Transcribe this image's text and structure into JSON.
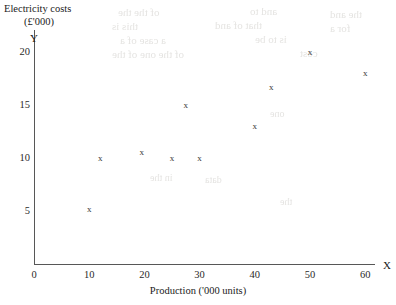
{
  "chart_data": {
    "type": "scatter",
    "title": "",
    "ylabel": "Electricity costs (£'000)",
    "ylabel_line1": "Electricity costs",
    "ylabel_line2": "(£'000)",
    "xlabel": "Production ('000 units)",
    "x_axis_letter": "X",
    "y_axis_letter": "Y",
    "xlim": [
      0,
      62
    ],
    "ylim": [
      0,
      22
    ],
    "xticks": [
      0,
      10,
      20,
      30,
      40,
      50,
      60
    ],
    "xtick_labels": [
      "0",
      "10",
      "20",
      "30",
      "40",
      "50",
      "60"
    ],
    "yticks": [
      5,
      10,
      15,
      20
    ],
    "ytick_labels": [
      "5",
      "10",
      "15",
      "20"
    ],
    "grid": false,
    "legend": null,
    "marker": "x",
    "points": [
      {
        "x": 10,
        "y": 5.2
      },
      {
        "x": 12,
        "y": 10.0
      },
      {
        "x": 19.5,
        "y": 10.6
      },
      {
        "x": 25,
        "y": 10.0
      },
      {
        "x": 27.5,
        "y": 15.0
      },
      {
        "x": 30,
        "y": 10.0
      },
      {
        "x": 40,
        "y": 13.0
      },
      {
        "x": 43,
        "y": 16.7
      },
      {
        "x": 50,
        "y": 20.0
      },
      {
        "x": 60,
        "y": 18.0
      }
    ]
  },
  "ghost_text": [
    {
      "text": "of the     the",
      "x": 118,
      "y": 6,
      "size": 11
    },
    {
      "text": "and to",
      "x": 250,
      "y": 5,
      "size": 11
    },
    {
      "text": "the    and",
      "x": 330,
      "y": 8,
      "size": 11
    },
    {
      "text": "this is",
      "x": 112,
      "y": 20,
      "size": 11
    },
    {
      "text": "that of and",
      "x": 215,
      "y": 19,
      "size": 11
    },
    {
      "text": "for a",
      "x": 330,
      "y": 22,
      "size": 11
    },
    {
      "text": "a case of a",
      "x": 120,
      "y": 34,
      "size": 11
    },
    {
      "text": "is to be",
      "x": 255,
      "y": 33,
      "size": 11
    },
    {
      "text": "of the one of the",
      "x": 112,
      "y": 48,
      "size": 11
    },
    {
      "text": "cost",
      "x": 300,
      "y": 47,
      "size": 11
    },
    {
      "text": "in the",
      "x": 150,
      "y": 172,
      "size": 10
    },
    {
      "text": "data",
      "x": 205,
      "y": 174,
      "size": 10
    },
    {
      "text": "one",
      "x": 270,
      "y": 108,
      "size": 10
    },
    {
      "text": "the",
      "x": 280,
      "y": 196,
      "size": 10
    }
  ]
}
